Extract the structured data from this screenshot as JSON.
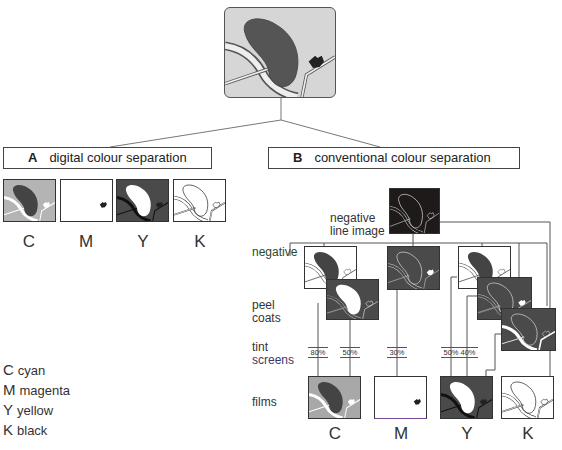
{
  "top_image": {
    "name": "source-map-artwork"
  },
  "section_a": {
    "letter": "A",
    "title": "digital colour separation",
    "separations": [
      {
        "label": "C"
      },
      {
        "label": "M"
      },
      {
        "label": "Y"
      },
      {
        "label": "K"
      }
    ]
  },
  "section_b": {
    "letter": "B",
    "title": "conventional colour separation",
    "negative_line_image_label": "negative\nline image",
    "row_labels": {
      "negative": "negative",
      "peel_coats_1": "peel",
      "peel_coats_2": "coats",
      "tint_1": "tint",
      "tint_2": "screens",
      "films": "films"
    },
    "tint_screens": [
      "80%",
      "50%",
      "30%",
      "50%",
      "40%"
    ],
    "films": [
      {
        "label": "C"
      },
      {
        "label": "M"
      },
      {
        "label": "Y"
      },
      {
        "label": "K"
      }
    ]
  },
  "legend": [
    {
      "key": "C",
      "value": "cyan"
    },
    {
      "key": "M",
      "value": "magenta"
    },
    {
      "key": "Y",
      "value": "yellow"
    },
    {
      "key": "K",
      "value": "black"
    }
  ],
  "colors": {
    "lake": "#555555",
    "land": "#d8d8d8",
    "road": "#f4f4f4",
    "frame": "#333333",
    "wire": "#555555",
    "dark": "#1e1a1a",
    "mid": "#4a4a4a",
    "tint_label_accent": "#3a3a6a"
  }
}
